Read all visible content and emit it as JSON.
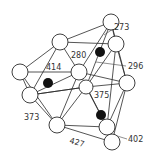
{
  "diagram": {
    "type": "ball-and-stick polyhedral structure",
    "labels": [
      {
        "text": "2.73",
        "display": "273",
        "x": 114,
        "y": 30
      },
      {
        "text": "2.80",
        "display": "280",
        "x": 71,
        "y": 58
      },
      {
        "text": "4.14",
        "display": "414",
        "x": 46,
        "y": 70
      },
      {
        "text": "2.96",
        "display": "296",
        "x": 128,
        "y": 69
      },
      {
        "text": "3.75",
        "display": "375",
        "x": 94,
        "y": 98
      },
      {
        "text": "3.73",
        "display": "373",
        "x": 24,
        "y": 120
      },
      {
        "text": "4.27",
        "display": "427",
        "x": 69,
        "y": 143
      },
      {
        "text": "4.02",
        "display": "402",
        "x": 128,
        "y": 142
      }
    ],
    "open_atoms": [
      {
        "id": "a1",
        "x": 111,
        "y": 22,
        "r": 8
      },
      {
        "id": "a2",
        "x": 116,
        "y": 44,
        "r": 8
      },
      {
        "id": "a3",
        "x": 60,
        "y": 42,
        "r": 8
      },
      {
        "id": "a4",
        "x": 20,
        "y": 72,
        "r": 8
      },
      {
        "id": "a5",
        "x": 79,
        "y": 72,
        "r": 8
      },
      {
        "id": "a6",
        "x": 86,
        "y": 87,
        "r": 7
      },
      {
        "id": "a7",
        "x": 127,
        "y": 83,
        "r": 8
      },
      {
        "id": "a8",
        "x": 30,
        "y": 95,
        "r": 8
      },
      {
        "id": "a9",
        "x": 57,
        "y": 125,
        "r": 8
      },
      {
        "id": "a10",
        "x": 107,
        "y": 127,
        "r": 8
      },
      {
        "id": "a11",
        "x": 112,
        "y": 142,
        "r": 8
      }
    ],
    "filled_atoms": [
      {
        "id": "b1",
        "x": 100,
        "y": 52,
        "r": 5
      },
      {
        "id": "b2",
        "x": 48,
        "y": 83,
        "r": 5
      },
      {
        "id": "b3",
        "x": 101,
        "y": 115,
        "r": 5
      }
    ]
  }
}
